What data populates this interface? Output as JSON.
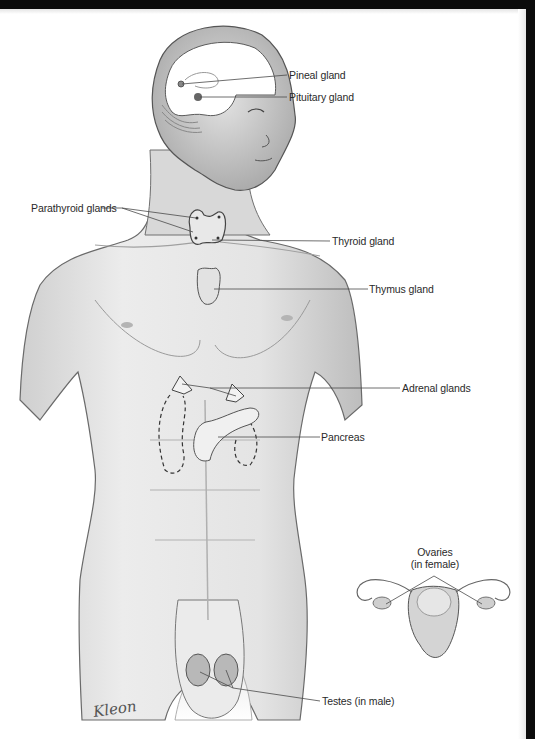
{
  "figure": {
    "colors": {
      "frame": "#0b0b0b",
      "background": "#ffffff",
      "ink": "#2a2a2a",
      "skin_shade": "#b8b8b8"
    }
  },
  "labels": {
    "pineal": "Pineal gland",
    "pituitary": "Pituitary gland",
    "parathyroid": "Parathyroid glands",
    "thyroid": "Thyroid gland",
    "thymus": "Thymus gland",
    "adrenal": "Adrenal glands",
    "pancreas": "Pancreas",
    "ovaries_line1": "Ovaries",
    "ovaries_line2": "(in female)",
    "testes": "Testes (in male)"
  },
  "signature": "Kleon"
}
